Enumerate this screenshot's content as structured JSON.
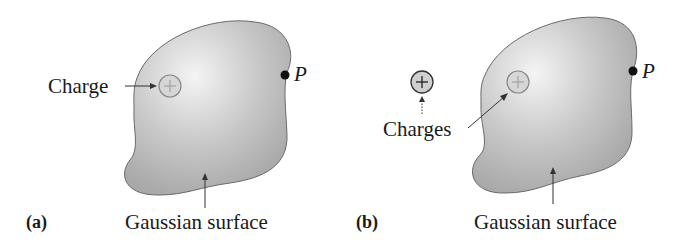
{
  "figure": {
    "panels": [
      {
        "id": "a",
        "tag": "(a)",
        "charge_label": "Charge",
        "surface_label": "Gaussian surface",
        "point_label": "P",
        "charges": [
          {
            "sign": "+",
            "location": "inside"
          }
        ]
      },
      {
        "id": "b",
        "tag": "(b)",
        "charge_label": "Charges",
        "surface_label": "Gaussian surface",
        "point_label": "P",
        "charges": [
          {
            "sign": "+",
            "location": "outside"
          },
          {
            "sign": "+",
            "location": "inside"
          }
        ]
      }
    ],
    "colors": {
      "surface_fill": "#b5b5b5",
      "surface_highlight": "#f2f2f2",
      "outline": "#555555",
      "point": "#111111"
    }
  }
}
